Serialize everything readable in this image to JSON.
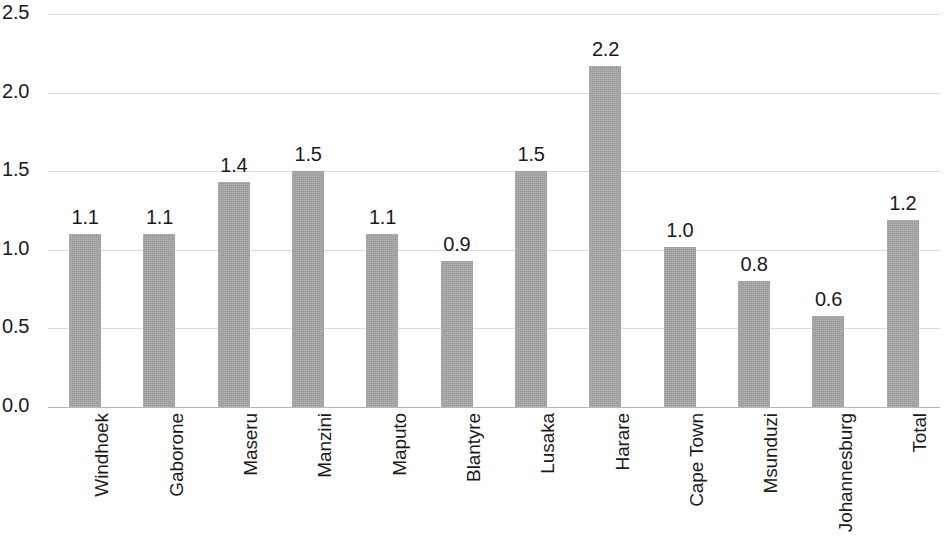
{
  "chart_data": {
    "type": "bar",
    "title": "",
    "subtitle": "",
    "xlabel": "",
    "ylabel": "",
    "categories": [
      "Windhoek",
      "Gaborone",
      "Maseru",
      "Manzini",
      "Maputo",
      "Blantyre",
      "Lusaka",
      "Harare",
      "Cape Town",
      "Msunduzi",
      "Johannesburg",
      "Total"
    ],
    "values": [
      1.1,
      1.1,
      1.4,
      1.5,
      1.1,
      0.9,
      1.5,
      2.2,
      1.0,
      0.8,
      0.6,
      1.2
    ],
    "data_labels": [
      "1.1",
      "1.1",
      "1.4",
      "1.5",
      "1.1",
      "0.9",
      "1.5",
      "2.2",
      "1.0",
      "0.8",
      "0.6",
      "1.2"
    ],
    "bar_tops_actual": [
      1.1,
      1.1,
      1.43,
      1.5,
      1.1,
      0.93,
      1.5,
      2.17,
      1.02,
      0.8,
      0.58,
      1.19
    ],
    "ylim": [
      0.0,
      2.5
    ],
    "ytick_values": [
      0.0,
      0.5,
      1.0,
      1.5,
      2.0,
      2.5
    ],
    "ytick_labels": [
      "0.0",
      "0.5",
      "1.0",
      "1.5",
      "2.0",
      "2.5"
    ],
    "grid": true,
    "grid_axis": "y",
    "legend": false,
    "legend_position": "none",
    "bar_color": "#a6a6a6",
    "grid_color": "#d6d6d6",
    "text_color": "#1a1a1a",
    "label_rotation": -90
  }
}
